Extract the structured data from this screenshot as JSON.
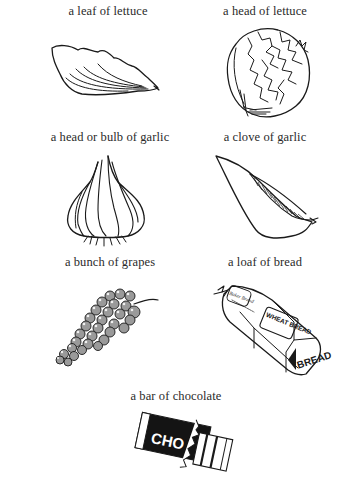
{
  "page": {
    "items": [
      {
        "label": "a leaf of lettuce",
        "illustration": "lettuce-leaf"
      },
      {
        "label": "a head of lettuce",
        "illustration": "lettuce-head"
      },
      {
        "label": "a head or bulb of garlic",
        "illustration": "garlic-bulb"
      },
      {
        "label": "a clove of garlic",
        "illustration": "garlic-clove"
      },
      {
        "label": "a bunch of grapes",
        "illustration": "grape-bunch"
      },
      {
        "label": "a loaf of bread",
        "illustration": "bread-loaf"
      },
      {
        "label": "a bar of chocolate",
        "illustration": "chocolate-bar"
      }
    ],
    "bread_bag_text": {
      "brand": "Baker Brand",
      "panel": "WHEAT BREAD",
      "end": "BREAD"
    },
    "chocolate_wrapper_text": "CHO",
    "colors": {
      "ink": "#1a1a1a",
      "background": "#ffffff"
    }
  }
}
